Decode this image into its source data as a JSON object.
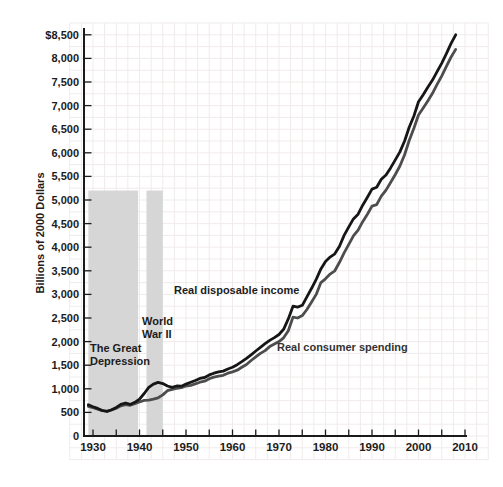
{
  "figure": {
    "y_axis_title": "Billions of 2000 Dollars",
    "annotations": {
      "depression": "The Great\nDepression",
      "wwii": "World\nWar II",
      "income": "Real disposable income",
      "spending": "Real consumer spending"
    }
  },
  "chart_data": {
    "type": "line",
    "title": "",
    "xlabel": "",
    "ylabel": "Billions of 2000 Dollars",
    "xlim": [
      1925,
      2011
    ],
    "ylim": [
      0,
      8500
    ],
    "grid": true,
    "legend_position": "inline-labels",
    "y_ticks": [
      {
        "v": 0,
        "label": "0"
      },
      {
        "v": 500,
        "label": "500"
      },
      {
        "v": 1000,
        "label": "1,000"
      },
      {
        "v": 1500,
        "label": "1,500"
      },
      {
        "v": 2000,
        "label": "2,000"
      },
      {
        "v": 2500,
        "label": "2,500"
      },
      {
        "v": 3000,
        "label": "3,000"
      },
      {
        "v": 3500,
        "label": "3,500"
      },
      {
        "v": 4000,
        "label": "4,000"
      },
      {
        "v": 4500,
        "label": "4,500"
      },
      {
        "v": 5000,
        "label": "5,000"
      },
      {
        "v": 5500,
        "label": "5,500"
      },
      {
        "v": 6000,
        "label": "6,000"
      },
      {
        "v": 6500,
        "label": "6,500"
      },
      {
        "v": 7000,
        "label": "7,000"
      },
      {
        "v": 7500,
        "label": "7,500"
      },
      {
        "v": 8000,
        "label": "8,000"
      },
      {
        "v": 8500,
        "label": "$8,500"
      }
    ],
    "x_ticks": [
      {
        "v": 1930,
        "label": "1930"
      },
      {
        "v": 1940,
        "label": "1940"
      },
      {
        "v": 1950,
        "label": "1950"
      },
      {
        "v": 1960,
        "label": "1960"
      },
      {
        "v": 1970,
        "label": "1970"
      },
      {
        "v": 1980,
        "label": "1980"
      },
      {
        "v": 1990,
        "label": "1990"
      },
      {
        "v": 2000,
        "label": "2000"
      },
      {
        "v": 2010,
        "label": "2010"
      }
    ],
    "x_minor_tick_step": 5,
    "x": [
      1929,
      1930,
      1931,
      1932,
      1933,
      1934,
      1935,
      1936,
      1937,
      1938,
      1939,
      1940,
      1941,
      1942,
      1943,
      1944,
      1945,
      1946,
      1947,
      1948,
      1949,
      1950,
      1951,
      1952,
      1953,
      1954,
      1955,
      1956,
      1957,
      1958,
      1959,
      1960,
      1961,
      1962,
      1963,
      1964,
      1965,
      1966,
      1967,
      1968,
      1969,
      1970,
      1971,
      1972,
      1973,
      1974,
      1975,
      1976,
      1977,
      1978,
      1979,
      1980,
      1981,
      1982,
      1983,
      1984,
      1985,
      1986,
      1987,
      1988,
      1989,
      1990,
      1991,
      1992,
      1993,
      1994,
      1995,
      1996,
      1997,
      1998,
      1999,
      2000,
      2001,
      2002,
      2003,
      2004,
      2005,
      2006,
      2007,
      2008
    ],
    "series": [
      {
        "name": "Real consumer spending",
        "color": "#4d4d4d",
        "values": [
          630,
          600,
          570,
          535,
          525,
          550,
          590,
          640,
          665,
          650,
          685,
          720,
          755,
          760,
          780,
          810,
          870,
          960,
          990,
          1010,
          1025,
          1060,
          1075,
          1105,
          1140,
          1160,
          1215,
          1245,
          1270,
          1285,
          1330,
          1360,
          1395,
          1455,
          1515,
          1600,
          1675,
          1750,
          1810,
          1895,
          1950,
          2000,
          2080,
          2230,
          2520,
          2500,
          2550,
          2680,
          2840,
          3000,
          3250,
          3330,
          3430,
          3500,
          3680,
          3880,
          4060,
          4240,
          4360,
          4540,
          4700,
          4870,
          4900,
          5080,
          5210,
          5370,
          5540,
          5720,
          5960,
          6260,
          6520,
          6800,
          6950,
          7100,
          7260,
          7450,
          7630,
          7830,
          8030,
          8190
        ]
      },
      {
        "name": "Real disposable income",
        "color": "#161616",
        "values": [
          660,
          620,
          585,
          540,
          520,
          555,
          605,
          670,
          700,
          670,
          715,
          780,
          900,
          1030,
          1100,
          1135,
          1110,
          1060,
          1030,
          1060,
          1055,
          1100,
          1140,
          1175,
          1220,
          1240,
          1295,
          1330,
          1360,
          1375,
          1420,
          1455,
          1510,
          1575,
          1645,
          1720,
          1800,
          1880,
          1955,
          2025,
          2085,
          2150,
          2260,
          2480,
          2750,
          2730,
          2770,
          2950,
          3130,
          3320,
          3540,
          3700,
          3790,
          3860,
          4020,
          4250,
          4430,
          4600,
          4700,
          4890,
          5060,
          5230,
          5270,
          5440,
          5530,
          5680,
          5850,
          6020,
          6250,
          6540,
          6780,
          7080,
          7230,
          7390,
          7540,
          7720,
          7900,
          8100,
          8320,
          8500
        ]
      }
    ],
    "shaded_bands": [
      {
        "label": "The Great Depression",
        "from": 1929,
        "to": 1939.7,
        "top": 5200,
        "color": "#d6d6d6"
      },
      {
        "label": "World War II",
        "from": 1941.5,
        "to": 1945,
        "top": 5200,
        "color": "#d6d6d6"
      }
    ],
    "colors": {
      "axis": "#1a1a1a",
      "grid": "#f1ebeb",
      "tick_text": "#1c1c1c"
    }
  }
}
